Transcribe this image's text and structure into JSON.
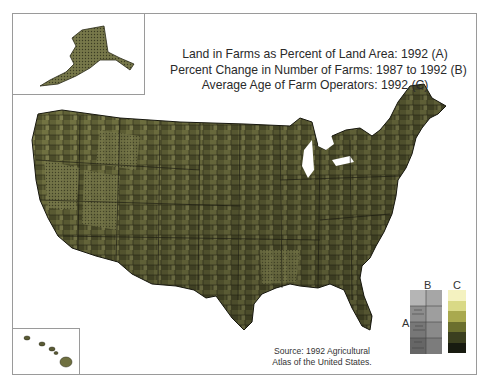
{
  "title": {
    "lines": [
      "Land in Farms as Percent of Land Area: 1992 (A)",
      "Percent Change in Number of Farms: 1987 to 1992 (B)",
      "Average Age of Farm Operators: 1992 (C)"
    ]
  },
  "insets": {
    "alaska": "Alaska inset",
    "hawaii": "Hawaii inset"
  },
  "legend": {
    "label_a": "A",
    "label_b": "B",
    "label_c": "C",
    "c_colors": [
      "#f4f2c0",
      "#d9d986",
      "#a9a94e",
      "#6b6f2e",
      "#3b3f1f",
      "#181b10"
    ],
    "a_b_texture_colors": [
      "#d6d6d6",
      "#8e8e8e",
      "#555555"
    ]
  },
  "source": {
    "line1": "Source: 1992 Agricultural",
    "line2": "Atlas of the United States."
  },
  "map_colors": {
    "light_olive": "#9a9a62",
    "mid_olive": "#6e6e3e",
    "dark_olive": "#3c3d22",
    "darkest": "#1f2013",
    "border": "#1a1a10"
  }
}
